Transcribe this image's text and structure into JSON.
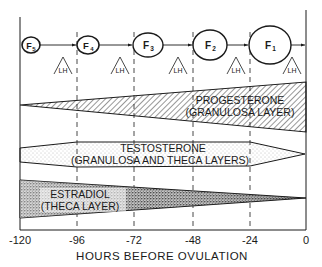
{
  "follicles": [
    {
      "label": "F",
      "sub": "5",
      "cx": 31,
      "cy": 45,
      "rx": 9,
      "ry": 8
    },
    {
      "label": "F",
      "sub": "4",
      "cx": 88,
      "cy": 45,
      "rx": 11,
      "ry": 9
    },
    {
      "label": "F",
      "sub": "3",
      "cx": 148,
      "cy": 45,
      "rx": 15,
      "ry": 12
    },
    {
      "label": "F",
      "sub": "2",
      "cx": 210,
      "cy": 45,
      "rx": 17,
      "ry": 15
    },
    {
      "label": "F",
      "sub": "1",
      "cx": 270,
      "cy": 45,
      "rx": 21,
      "ry": 19
    }
  ],
  "lh_markers": {
    "label": "LH",
    "x": [
      63,
      120,
      178,
      236,
      292
    ]
  },
  "hormones": {
    "progesterone": {
      "name": "PROGESTERONE",
      "source": "(GRANULOSA LAYER)"
    },
    "testosterone": {
      "name": "TESTOSTERONE",
      "source": "(GRANULOSA AND THECA LAYERS)"
    },
    "estradiol": {
      "name": "ESTRADIOL",
      "source": "(THECA LAYER)"
    }
  },
  "x_axis": {
    "label": "HOURS BEFORE OVULATION",
    "ticks": [
      "-120",
      "-96",
      "-72",
      "-48",
      "-24",
      "0"
    ],
    "tick_x": [
      20,
      77,
      134,
      193,
      250,
      306
    ]
  },
  "colors": {
    "ink": "#1a1a1a",
    "background": "#ffffff",
    "stipple": "#555555"
  }
}
